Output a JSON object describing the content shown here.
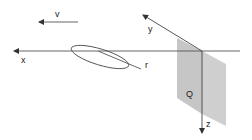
{
  "diagram": {
    "labels": {
      "v": "v",
      "x": "x",
      "y": "y",
      "z": "z",
      "r": "r",
      "plane": "Q"
    },
    "colors": {
      "line": "#444444",
      "plane_fill": "#c8c8c8",
      "plane_shade": "#b4b4b4",
      "background": "#ffffff"
    }
  }
}
